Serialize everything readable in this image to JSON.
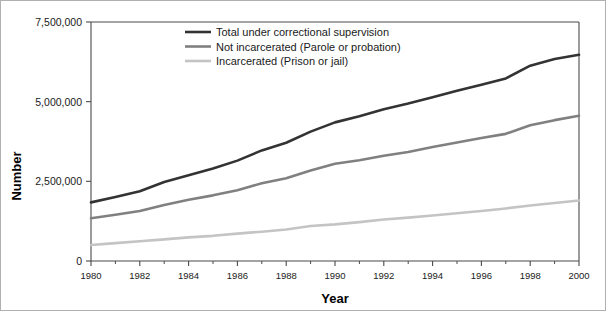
{
  "chart_data": {
    "type": "line",
    "title": "",
    "xlabel": "Year",
    "ylabel": "Number",
    "xlim": [
      1980,
      2000
    ],
    "ylim": [
      0,
      7500000
    ],
    "grid": false,
    "legend_position": "top-center",
    "x": [
      1980,
      1981,
      1982,
      1983,
      1984,
      1985,
      1986,
      1987,
      1988,
      1989,
      1990,
      1991,
      1992,
      1993,
      1994,
      1995,
      1996,
      1997,
      1998,
      1999,
      2000
    ],
    "x_tick_labels": [
      "1980",
      "1982",
      "1984",
      "1986",
      "1988",
      "1990",
      "1992",
      "1994",
      "1996",
      "1998",
      "2000"
    ],
    "x_tick_values": [
      1980,
      1982,
      1984,
      1986,
      1988,
      1990,
      1992,
      1994,
      1996,
      1998,
      2000
    ],
    "x_minor_tick_values": [
      1981,
      1983,
      1985,
      1987,
      1989,
      1991,
      1993,
      1995,
      1997,
      1999
    ],
    "y_tick_labels": [
      "0",
      "2,500,000",
      "5,000,000",
      "7,500,000"
    ],
    "y_tick_values": [
      0,
      2500000,
      5000000,
      7500000
    ],
    "series": [
      {
        "name": "Total under correctional supervision",
        "color": "#333333",
        "width": 2.6,
        "values": [
          1840000,
          2010000,
          2190000,
          2480000,
          2690000,
          2900000,
          3150000,
          3470000,
          3710000,
          4060000,
          4350000,
          4540000,
          4760000,
          4940000,
          5140000,
          5340000,
          5530000,
          5730000,
          6130000,
          6340000,
          6470000
        ]
      },
      {
        "name": "Not incarcerated (Parole or probation)",
        "color": "#808080",
        "width": 2.6,
        "values": [
          1340000,
          1450000,
          1570000,
          1760000,
          1920000,
          2060000,
          2220000,
          2440000,
          2600000,
          2840000,
          3050000,
          3160000,
          3300000,
          3420000,
          3580000,
          3720000,
          3860000,
          3990000,
          4260000,
          4420000,
          4560000
        ]
      },
      {
        "name": "Incarcerated (Prison or jail)",
        "color": "#c4c4c4",
        "width": 2.6,
        "values": [
          500000,
          560000,
          620000,
          680000,
          740000,
          790000,
          860000,
          920000,
          990000,
          1100000,
          1150000,
          1220000,
          1300000,
          1360000,
          1430000,
          1500000,
          1570000,
          1650000,
          1740000,
          1820000,
          1900000
        ]
      }
    ]
  },
  "legend": {
    "entries": [
      {
        "label": "Total under correctional supervision"
      },
      {
        "label": "Not incarcerated (Parole or probation)"
      },
      {
        "label": "Incarcerated (Prison or jail)"
      }
    ]
  }
}
